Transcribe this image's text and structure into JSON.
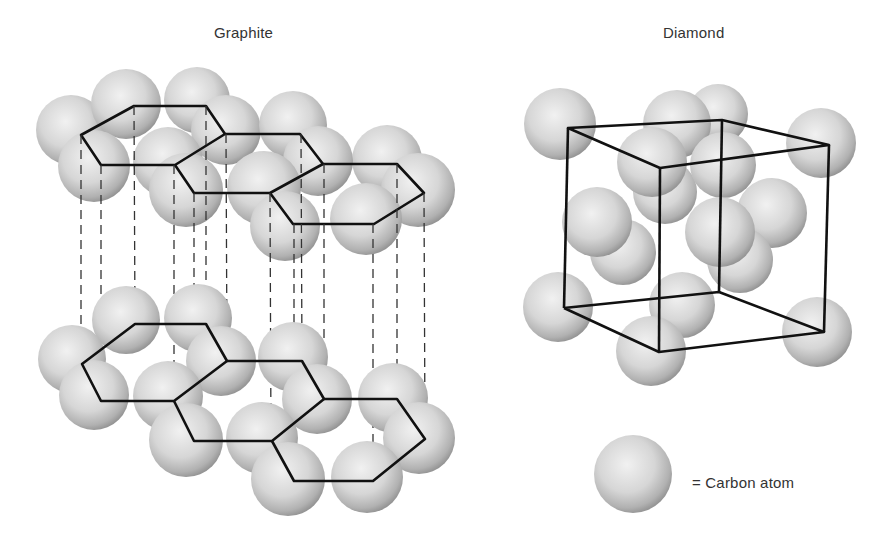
{
  "titles": {
    "graphite": "Graphite",
    "diamond": "Diamond"
  },
  "legend": {
    "symbol": "sphere",
    "label": "= Carbon atom"
  },
  "colors": {
    "atom_light": "#ededed",
    "atom_dark": "#8e8e8e",
    "bond_line": "#111111",
    "projection_line": "#333333"
  }
}
